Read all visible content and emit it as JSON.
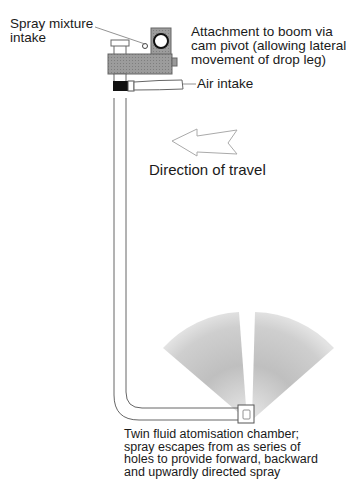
{
  "diagram": {
    "labels": {
      "spray_mixture_intake": [
        "Spray mixture",
        "intake"
      ],
      "attachment": [
        "Attachment to boom via",
        "cam pivot (allowing lateral",
        "movement of drop leg)"
      ],
      "air_intake": "Air intake",
      "direction": "Direction of travel",
      "chamber": [
        "Twin fluid atomisation chamber;",
        "spray escapes from as series of",
        "holes to provide forward, backward",
        "and upwardly directed spray"
      ]
    },
    "colors": {
      "line": "#555555",
      "body_grey": "#9a9a9a",
      "spray_grey": "#c8c8c8",
      "collar": "#111111"
    }
  }
}
